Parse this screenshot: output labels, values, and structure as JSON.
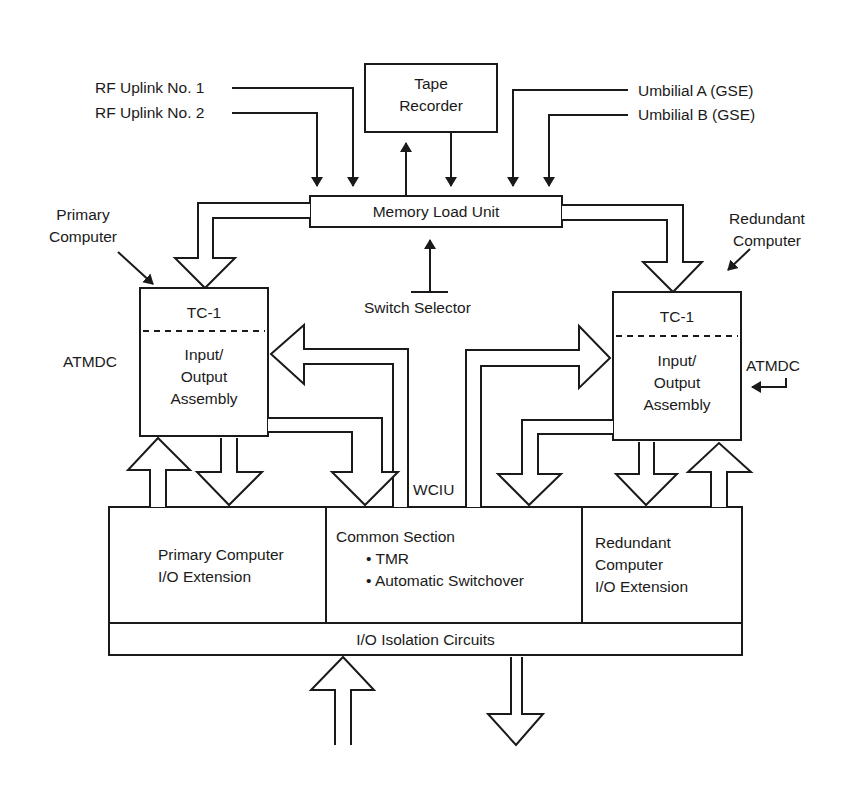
{
  "inputs": {
    "rf_uplink_1": "RF Uplink No. 1",
    "rf_uplink_2": "RF Uplink No. 2",
    "umbilical_a": "Umbilial A (GSE)",
    "umbilical_b": "Umbilial B (GSE)"
  },
  "tape_recorder": {
    "line1": "Tape",
    "line2": "Recorder"
  },
  "memory_load_unit": "Memory Load Unit",
  "switch_selector": "Switch Selector",
  "primary": {
    "label_line1": "Primary",
    "label_line2": "Computer",
    "tc": "TC-1",
    "io_line1": "Input/",
    "io_line2": "Output",
    "io_line3": "Assembly",
    "atmdc": "ATMDC"
  },
  "redundant": {
    "label_line1": "Redundant",
    "label_line2": "Computer",
    "tc": "TC-1",
    "io_line1": "Input/",
    "io_line2": "Output",
    "io_line3": "Assembly",
    "atmdc": "ATMDC"
  },
  "wciu": "WCIU",
  "wciu_sections": {
    "primary_ext": {
      "line1": "Primary Computer",
      "line2": "I/O Extension"
    },
    "common": {
      "title": "Common Section",
      "bullets": [
        "TMR",
        "Automatic Switchover"
      ]
    },
    "redundant_ext": {
      "line1": "Redundant",
      "line2": "Computer",
      "line3": "I/O Extension"
    }
  },
  "isolation": "I/O Isolation Circuits",
  "colors": {
    "line": "#1a1a1a",
    "background": "#ffffff"
  }
}
